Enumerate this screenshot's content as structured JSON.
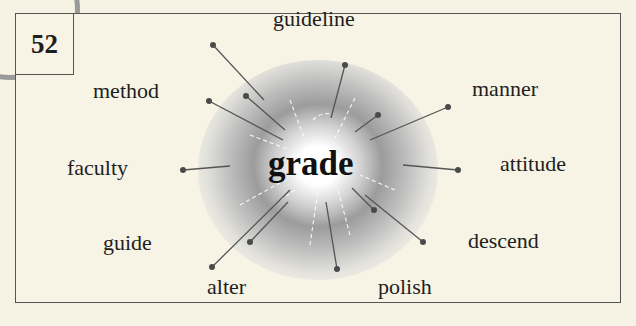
{
  "card": {
    "number": "52",
    "center_word": "grade",
    "words": [
      {
        "id": "guideline",
        "label": "guideline"
      },
      {
        "id": "method",
        "label": "method"
      },
      {
        "id": "manner",
        "label": "manner"
      },
      {
        "id": "faculty",
        "label": "faculty"
      },
      {
        "id": "attitude",
        "label": "attitude"
      },
      {
        "id": "guide",
        "label": "guide"
      },
      {
        "id": "descend",
        "label": "descend"
      },
      {
        "id": "alter",
        "label": "alter"
      },
      {
        "id": "polish",
        "label": "polish"
      }
    ]
  },
  "colors": {
    "background": "#f6f3e4",
    "frame_border": "#555555",
    "text": "#1e1e1e",
    "ray_line": "#555555",
    "ray_dot": "#555555"
  }
}
